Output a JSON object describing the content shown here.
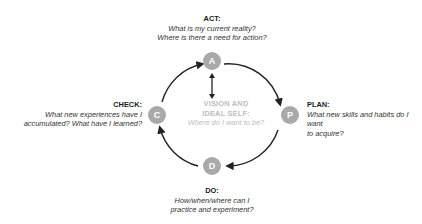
{
  "diagram": {
    "center": {
      "title_line1": "VISION AND",
      "title_line2": "IDEAL SELF:",
      "question": "Where do I want to be?"
    },
    "nodes": {
      "act": {
        "letter": "A",
        "title": "ACT:",
        "question_line1": "What is my current reality?",
        "question_line2": "Where is there a need for action?"
      },
      "plan": {
        "letter": "P",
        "title": "PLAN:",
        "question_line1": "What new skills and habits do I want",
        "question_line2": "to acquire?"
      },
      "do": {
        "letter": "D",
        "title": "DO:",
        "question_line1": "How/when/where can I",
        "question_line2": "practice and experiment?"
      },
      "check": {
        "letter": "C",
        "title": "CHECK:",
        "question_line1": "What new experiences have I",
        "question_line2": "accumulated? What have I learned?"
      }
    },
    "colors": {
      "node_fill": "#a9a9a9",
      "arrow": "#222222",
      "center_text": "#bdbdbd"
    }
  }
}
